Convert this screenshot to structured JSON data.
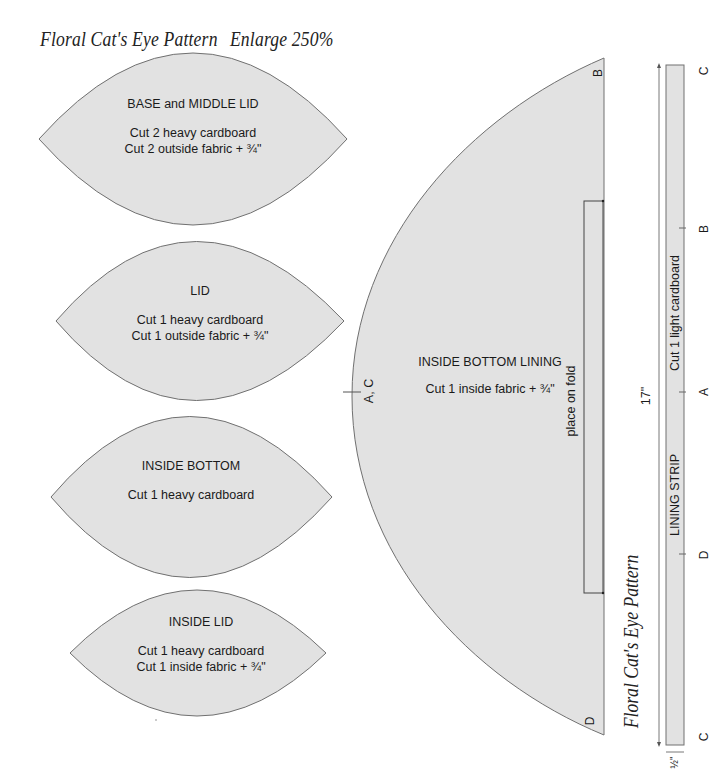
{
  "header": {
    "title": "Floral Cat's Eye Pattern",
    "enlarge": "Enlarge 250%"
  },
  "pieces": [
    {
      "name": "BASE and MIDDLE LID",
      "lines": [
        "Cut 2 heavy cardboard",
        "Cut 2 outside fabric + ¾\""
      ]
    },
    {
      "name": "LID",
      "lines": [
        "Cut 1 heavy cardboard",
        "Cut 1 outside fabric + ¾\""
      ]
    },
    {
      "name": "INSIDE BOTTOM",
      "lines": [
        "Cut 1 heavy cardboard"
      ]
    },
    {
      "name": "INSIDE LID",
      "lines": [
        "Cut 1 heavy cardboard",
        "Cut 1 inside fabric + ¾\""
      ]
    }
  ],
  "lining": {
    "name": "INSIDE BOTTOM LINING",
    "cut": "Cut 1 inside fabric + ¾\"",
    "fold": "place on fold",
    "mark_ac": "A, C",
    "mark_b": "B",
    "mark_d": "D"
  },
  "strip": {
    "name": "LINING STRIP",
    "cut": "Cut 1 light cardboard",
    "length": "17\"",
    "width": "½\"",
    "marks": [
      "C",
      "B",
      "A",
      "D",
      "C"
    ]
  },
  "side_title": "Floral Cat's Eye Pattern",
  "colors": {
    "fill": "#e2e2e2",
    "stroke": "#6e6e6e",
    "text": "#1a1a1a"
  }
}
